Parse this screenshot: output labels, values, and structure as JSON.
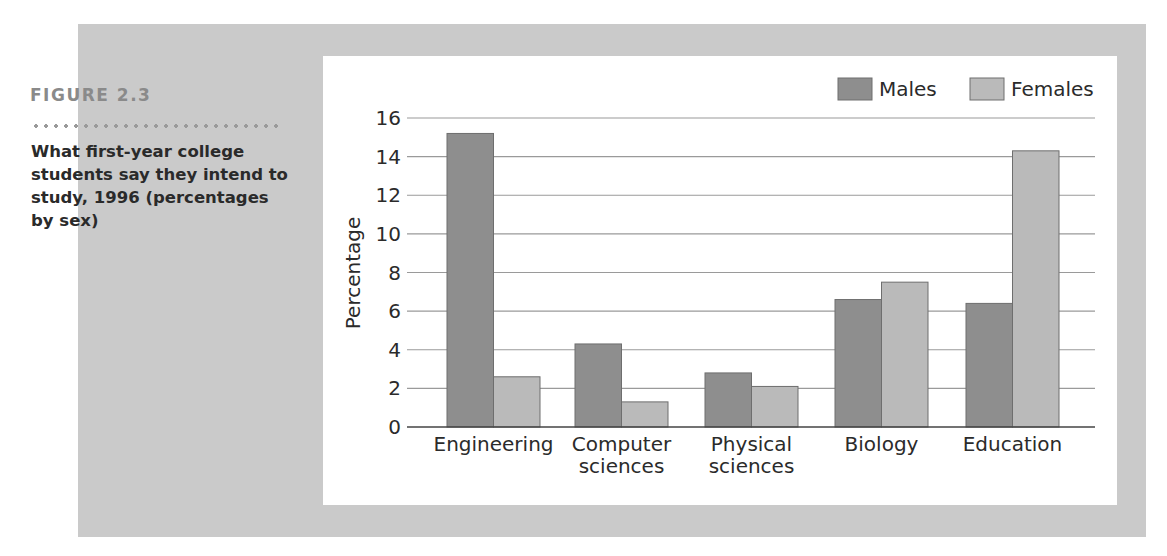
{
  "figure": {
    "label": "FIGURE 2.3",
    "caption": "What first-year college students say they intend to study, 1996 (percentages by sex)"
  },
  "colors": {
    "panel": "#cacaca",
    "males": "#8e8e8e",
    "females": "#bababa",
    "gridline": "#9a9a9a"
  },
  "chart_data": {
    "type": "bar",
    "title": "What first-year college students say they intend to study, 1996 (percentages by sex)",
    "categories": [
      "Engineering",
      "Computer sciences",
      "Physical sciences",
      "Biology",
      "Education"
    ],
    "category_lines": [
      [
        "Engineering"
      ],
      [
        "Computer",
        "sciences"
      ],
      [
        "Physical",
        "sciences"
      ],
      [
        "Biology"
      ],
      [
        "Education"
      ]
    ],
    "series": [
      {
        "name": "Males",
        "values": [
          15.2,
          4.3,
          2.8,
          6.6,
          6.4
        ]
      },
      {
        "name": "Females",
        "values": [
          2.6,
          1.3,
          2.1,
          7.5,
          14.3
        ]
      }
    ],
    "xlabel": "",
    "ylabel": "Percentage",
    "ylim": [
      0,
      16
    ],
    "yticks": [
      0,
      2,
      4,
      6,
      8,
      10,
      12,
      14,
      16
    ],
    "grid": true,
    "legend_position": "top-right"
  }
}
